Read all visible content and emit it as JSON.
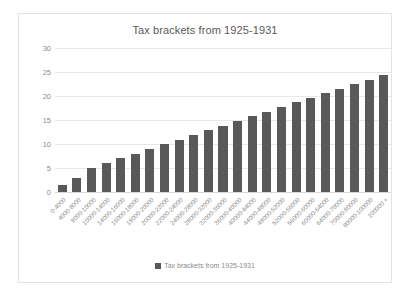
{
  "chart_data": {
    "type": "bar",
    "title": "Tax brackets from 1925-1931",
    "xlabel": "",
    "ylabel": "",
    "ylim": [
      0,
      30
    ],
    "yticks": [
      0,
      5,
      10,
      15,
      20,
      25,
      30
    ],
    "grid": true,
    "legend_position": "bottom",
    "legend": [
      "Tax brackets from 1925-1931"
    ],
    "series_name": "Tax brackets from 1925-1931",
    "bar_color": "#595959",
    "gridline_color": "#e8e8e8",
    "text_color": "#8c8c8c",
    "title_color": "#595959",
    "border_color": "#e3e3e3",
    "categories": [
      "0-4000",
      "4000-8000",
      "8000-10000",
      "10000-14000",
      "14000-16000",
      "16000-18000",
      "18000-20000",
      "20000-22000",
      "22000-24000",
      "24000-28000",
      "28000-32000",
      "32000-36000",
      "36000-40000",
      "40000-44000",
      "44000-48000",
      "48000-52000",
      "52000-56000",
      "56000-60000",
      "60000-64000",
      "64000-70000",
      "70000-80000",
      "80000-100000",
      "100000 +"
    ],
    "values": [
      1.5,
      3,
      5,
      6,
      7,
      8,
      9,
      10,
      10.9,
      11.9,
      12.9,
      13.8,
      14.8,
      15.8,
      16.7,
      17.7,
      18.7,
      19.6,
      20.6,
      21.5,
      22.4,
      23.4,
      24.4
    ]
  }
}
